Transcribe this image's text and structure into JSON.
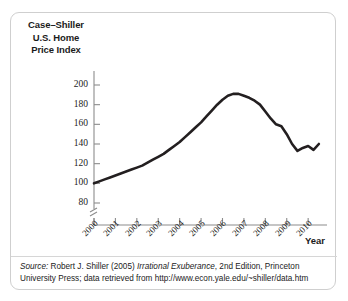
{
  "figure": {
    "yaxis_title_lines": [
      "Case–Shiller",
      "U.S. Home",
      "Price Index"
    ],
    "xaxis_title": "Year",
    "source": {
      "label": "Source:",
      "text_before_italic": " Robert J. Shiller (2005) ",
      "italic_title": "Irrational Exuberance",
      "text_after_italic": ", 2nd Edition, Princeton",
      "line2": "University Press; data retrieved from http://www.econ.yale.edu/~shiller/data.htm",
      "line1_full": "Source: Robert J. Shiller (2005) Irrational Exuberance, 2nd Edition, Princeton"
    }
  },
  "chart_data": {
    "type": "line",
    "title": "",
    "xlabel": "Year",
    "ylabel": "Case–Shiller U.S. Home Price Index",
    "xlim": [
      2000,
      2010.6
    ],
    "ylim": [
      76,
      208
    ],
    "y_axis_break": true,
    "grid": false,
    "legend": null,
    "line_color": "#231f20",
    "line_width_px": 2.6,
    "ytick_labels": [
      "200",
      "180",
      "160",
      "140",
      "120",
      "100",
      "80"
    ],
    "yticks": [
      200,
      180,
      160,
      140,
      120,
      100,
      80
    ],
    "xtick_labels": [
      "2000",
      "2001",
      "2002",
      "2003",
      "2004",
      "2005",
      "2006",
      "2007",
      "2008",
      "2009",
      "2010"
    ],
    "xticks": [
      2000,
      2001,
      2002,
      2003,
      2004,
      2005,
      2006,
      2007,
      2008,
      2009,
      2010
    ],
    "series": [
      {
        "name": "Case-Shiller U.S. Home Price Index",
        "x": [
          2000.0,
          2000.25,
          2000.5,
          2000.75,
          2001.0,
          2001.25,
          2001.5,
          2001.75,
          2002.0,
          2002.25,
          2002.5,
          2002.75,
          2003.0,
          2003.25,
          2003.5,
          2003.75,
          2004.0,
          2004.25,
          2004.5,
          2004.75,
          2005.0,
          2005.25,
          2005.5,
          2005.75,
          2006.0,
          2006.25,
          2006.5,
          2006.75,
          2007.0,
          2007.25,
          2007.5,
          2007.75,
          2008.0,
          2008.25,
          2008.5,
          2008.75,
          2009.0,
          2009.25,
          2009.5,
          2009.75,
          2010.0,
          2010.25,
          2010.5
        ],
        "values": [
          100,
          102,
          104,
          106,
          108,
          110,
          112,
          114,
          116,
          118,
          121,
          124,
          127,
          130,
          134,
          138,
          142,
          147,
          152,
          157,
          162,
          168,
          174,
          180,
          185,
          189,
          191,
          191,
          189,
          187,
          184,
          180,
          173,
          166,
          160,
          158,
          150,
          140,
          133,
          136,
          138,
          134,
          140
        ]
      }
    ]
  }
}
